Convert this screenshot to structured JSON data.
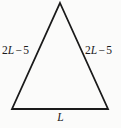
{
  "figure": {
    "kind": "isosceles-triangle-diagram",
    "background_color": "#fbfbfa",
    "stroke_color": "#1a1a1a",
    "stroke_width": 1.8,
    "vertices": {
      "apex": [
        60,
        3
      ],
      "base_left": [
        12,
        109
      ],
      "base_right": [
        108,
        109
      ]
    }
  },
  "labels": {
    "left_side": {
      "text": "2L − 5",
      "coefficient": "2",
      "variable": "L",
      "operator": "−",
      "constant": "5"
    },
    "right_side": {
      "text": "2L − 5",
      "coefficient": "2",
      "variable": "L",
      "operator": "−",
      "constant": "5"
    },
    "base": {
      "text": "L",
      "variable": "L"
    }
  }
}
